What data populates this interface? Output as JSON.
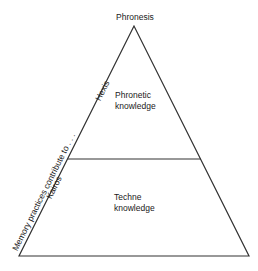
{
  "diagram": {
    "type": "pyramid",
    "apex_label": "Phronesis",
    "levels": [
      {
        "name": "top",
        "line1": "Phronetic",
        "line2": "knowledge"
      },
      {
        "name": "bottom",
        "line1": "Techne",
        "line2": "knowledge"
      }
    ],
    "side_labels": {
      "upper": "Hexis",
      "lower": "Kairos",
      "outer": "Memory practices contribute to . . ."
    },
    "colors": {
      "stroke": "#333333",
      "background": "#ffffff"
    }
  }
}
